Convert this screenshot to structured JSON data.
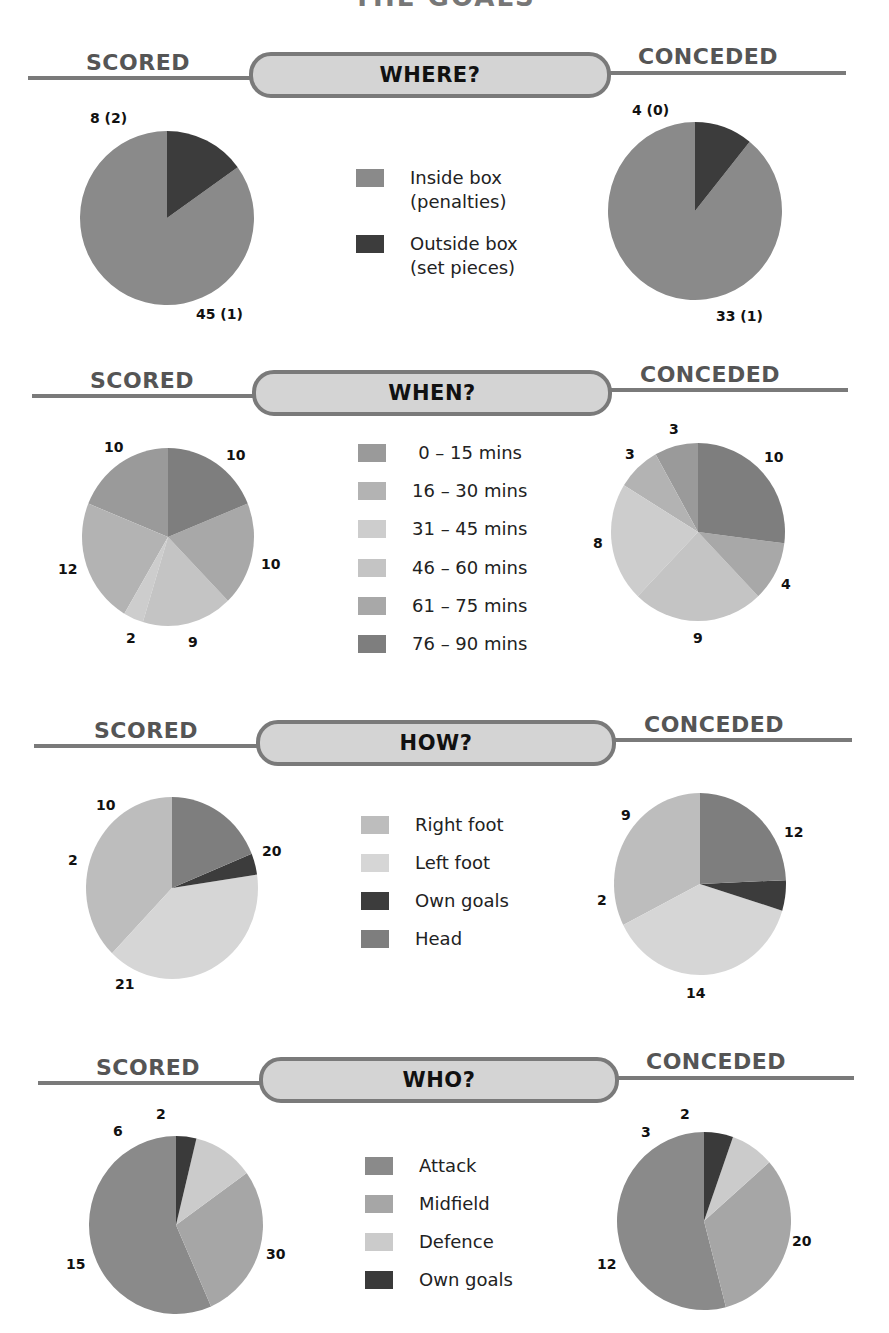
{
  "page": {
    "title_partial": "THE GOALS",
    "side_labels": {
      "left": "SCORED",
      "right": "CONCEDED"
    }
  },
  "colors": {
    "rule": "#7a7a7a",
    "pill_fill": "#d4d4d4",
    "where": {
      "inside": "#8a8a8a",
      "outside": "#3c3c3c"
    },
    "when": [
      "#9a9a9a",
      "#b3b3b3",
      "#cdcdcd",
      "#c4c4c4",
      "#a8a8a8",
      "#7e7e7e"
    ],
    "how": {
      "right_foot": "#bdbdbd",
      "left_foot": "#d6d6d6",
      "own_goals": "#3c3c3c",
      "head": "#7e7e7e"
    },
    "who": {
      "attack": "#8a8a8a",
      "midfield": "#a6a6a6",
      "defence": "#cbcbcb",
      "own_goals": "#3a3a3a"
    }
  },
  "sections": {
    "where": {
      "title": "WHERE?",
      "legend": [
        {
          "line1": "Inside box",
          "line2": "(penalties)"
        },
        {
          "line1": "Outside box",
          "line2": "(set pieces)"
        }
      ],
      "scored_labels": {
        "inside": "45 (1)",
        "outside": "8 (2)"
      },
      "conceded_labels": {
        "inside": "33 (1)",
        "outside": "4 (0)"
      }
    },
    "when": {
      "title": "WHEN?",
      "legend": [
        "0 – 15 mins",
        "16 – 30 mins",
        "31 – 45 mins",
        "46 – 60 mins",
        "61 – 75 mins",
        "76 – 90 mins"
      ],
      "scored_labels": [
        "10",
        "12",
        "2",
        "9",
        "10",
        "10"
      ],
      "conceded_labels": [
        "3",
        "3",
        "8",
        "9",
        "4",
        "10"
      ]
    },
    "how": {
      "title": "HOW?",
      "legend": [
        "Right foot",
        "Left foot",
        "Own goals",
        "Head"
      ],
      "scored_labels": [
        "20",
        "21",
        "2",
        "10"
      ],
      "conceded_labels": [
        "12",
        "14",
        "2",
        "9"
      ]
    },
    "who": {
      "title": "WHO?",
      "legend": [
        "Attack",
        "Midfield",
        "Defence",
        "Own goals"
      ],
      "scored_labels": [
        "30",
        "15",
        "6",
        "2"
      ],
      "conceded_labels": [
        "20",
        "12",
        "3",
        "2"
      ]
    }
  },
  "chart_data": [
    {
      "type": "pie",
      "title": "WHERE? – Scored",
      "categories": [
        "Inside box (penalties)",
        "Outside box (set pieces)"
      ],
      "values": [
        45,
        8
      ],
      "annotations": {
        "penalties_inside": 1,
        "set_pieces_outside": 2
      },
      "labels": [
        "45 (1)",
        "8 (2)"
      ]
    },
    {
      "type": "pie",
      "title": "WHERE? – Conceded",
      "categories": [
        "Inside box (penalties)",
        "Outside box (set pieces)"
      ],
      "values": [
        33,
        4
      ],
      "annotations": {
        "penalties_inside": 1,
        "set_pieces_outside": 0
      },
      "labels": [
        "33 (1)",
        "4 (0)"
      ]
    },
    {
      "type": "pie",
      "title": "WHEN? – Scored",
      "categories": [
        "0 – 15 mins",
        "16 – 30 mins",
        "31 – 45 mins",
        "46 – 60 mins",
        "61 – 75 mins",
        "76 – 90 mins"
      ],
      "values": [
        10,
        12,
        2,
        9,
        10,
        10
      ]
    },
    {
      "type": "pie",
      "title": "WHEN? – Conceded",
      "categories": [
        "0 – 15 mins",
        "16 – 30 mins",
        "31 – 45 mins",
        "46 – 60 mins",
        "61 – 75 mins",
        "76 – 90 mins"
      ],
      "values": [
        3,
        3,
        8,
        9,
        4,
        10
      ]
    },
    {
      "type": "pie",
      "title": "HOW? – Scored",
      "categories": [
        "Right foot",
        "Left foot",
        "Own goals",
        "Head"
      ],
      "values": [
        20,
        21,
        2,
        10
      ]
    },
    {
      "type": "pie",
      "title": "HOW? – Conceded",
      "categories": [
        "Right foot",
        "Left foot",
        "Own goals",
        "Head"
      ],
      "values": [
        12,
        14,
        2,
        9
      ]
    },
    {
      "type": "pie",
      "title": "WHO? – Scored",
      "categories": [
        "Attack",
        "Midfield",
        "Defence",
        "Own goals"
      ],
      "values": [
        30,
        15,
        6,
        2
      ]
    },
    {
      "type": "pie",
      "title": "WHO? – Conceded",
      "categories": [
        "Attack",
        "Midfield",
        "Defence",
        "Own goals"
      ],
      "values": [
        20,
        12,
        3,
        2
      ]
    }
  ]
}
